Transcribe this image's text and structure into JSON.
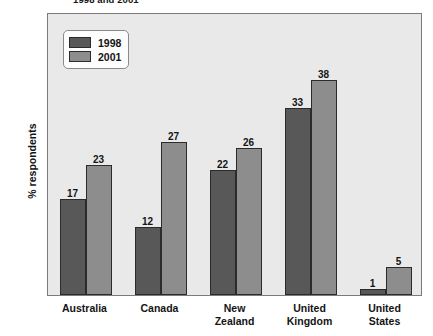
{
  "chart_data": {
    "type": "bar",
    "title": "1998 and 2001",
    "xlabel": "",
    "ylabel": "% respondents",
    "ylim": [
      0,
      50
    ],
    "ytick_step": 5,
    "yticks": [
      0,
      5,
      10,
      15,
      20,
      25,
      30,
      35,
      40,
      45,
      50
    ],
    "grid": false,
    "legend_position": "top-left",
    "categories": [
      "Australia",
      "Canada",
      "New Zealand",
      "United Kingdom",
      "United States"
    ],
    "series": [
      {
        "name": "1998",
        "color": "#585858",
        "values": [
          17,
          12,
          22,
          33,
          1
        ]
      },
      {
        "name": "2001",
        "color": "#8d8d8d",
        "values": [
          23,
          27,
          26,
          38,
          5
        ]
      }
    ]
  },
  "colors": {
    "plot_background": "#e9e9e9",
    "frame": "#7b7b7b",
    "bar_outline": "#2b2b2b",
    "text": "#141414",
    "legend_background": "#fdfdfd"
  }
}
